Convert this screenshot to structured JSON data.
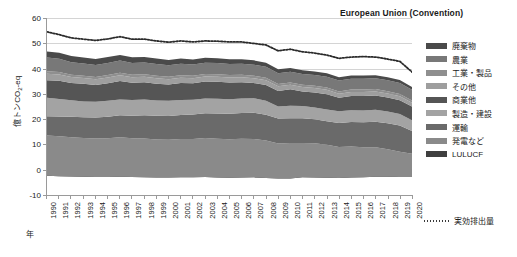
{
  "chart_data": {
    "type": "area",
    "title": "European Union (Convention)",
    "xlabel": "年",
    "ylabel": "億トンCO2-eq",
    "ylim": [
      -10,
      60
    ],
    "ytick_values": [
      -10,
      0,
      10,
      20,
      30,
      40,
      50,
      60
    ],
    "grid": true,
    "legend_position": "right",
    "stacked": true,
    "categories": [
      "1990",
      "1991",
      "1992",
      "1993",
      "1994",
      "1995",
      "1996",
      "1997",
      "1998",
      "1999",
      "2000",
      "2001",
      "2002",
      "2003",
      "2004",
      "2005",
      "2006",
      "2007",
      "2008",
      "2009",
      "2010",
      "2011",
      "2012",
      "2013",
      "2014",
      "2015",
      "2016",
      "2017",
      "2018",
      "2019",
      "2020"
    ],
    "stack_order_bottom_to_top": [
      "LULUCF",
      "発電など",
      "運輸",
      "製造・建設",
      "商業他",
      "その他",
      "工業・製品",
      "農業",
      "廃棄物"
    ],
    "series": [
      {
        "name": "LULUCF",
        "color": "#3f3f3f",
        "values": [
          -2.6,
          -2.8,
          -2.9,
          -3.0,
          -3.1,
          -3.1,
          -3.0,
          -3.1,
          -3.2,
          -3.3,
          -3.3,
          -3.2,
          -3.2,
          -3.1,
          -3.3,
          -3.4,
          -3.3,
          -3.2,
          -3.5,
          -3.6,
          -3.6,
          -3.2,
          -3.3,
          -3.4,
          -3.5,
          -3.3,
          -3.2,
          -3.0,
          -3.0,
          -3.1,
          -3.1
        ]
      },
      {
        "name": "発電など",
        "color": "#8a8a8a",
        "values": [
          16.0,
          15.9,
          15.6,
          15.4,
          15.3,
          15.4,
          15.7,
          15.4,
          15.4,
          15.1,
          15.0,
          15.2,
          15.2,
          15.5,
          15.4,
          15.3,
          15.4,
          15.2,
          14.9,
          13.8,
          14.0,
          13.6,
          13.6,
          13.1,
          12.3,
          12.3,
          11.9,
          11.7,
          11.0,
          10.1,
          9.3
        ]
      },
      {
        "name": "運輸",
        "color": "#6a6a6a",
        "values": [
          7.6,
          7.8,
          8.1,
          8.2,
          8.3,
          8.5,
          8.7,
          8.9,
          9.2,
          9.4,
          9.4,
          9.5,
          9.7,
          9.8,
          10.0,
          10.1,
          10.2,
          10.4,
          10.2,
          9.9,
          9.8,
          9.8,
          9.5,
          9.4,
          9.6,
          9.8,
          10.0,
          10.2,
          10.3,
          10.4,
          9.0
        ]
      },
      {
        "name": "製造・建設",
        "color": "#a3a3a3",
        "values": [
          7.4,
          7.0,
          6.6,
          6.3,
          6.3,
          6.4,
          6.3,
          6.3,
          6.3,
          6.1,
          6.1,
          6.0,
          5.9,
          5.9,
          5.9,
          5.8,
          5.8,
          5.8,
          5.6,
          4.8,
          5.0,
          4.9,
          4.7,
          4.6,
          4.6,
          4.6,
          4.6,
          4.7,
          4.6,
          4.5,
          4.3
        ]
      },
      {
        "name": "商業他",
        "color": "#555555",
        "values": [
          6.9,
          7.2,
          6.8,
          7.0,
          6.6,
          6.9,
          7.3,
          6.8,
          6.8,
          6.6,
          6.4,
          6.7,
          6.5,
          6.7,
          6.7,
          6.6,
          6.4,
          6.0,
          6.2,
          6.2,
          6.5,
          5.8,
          6.0,
          6.1,
          5.4,
          5.7,
          5.8,
          5.7,
          5.6,
          5.5,
          5.4
        ]
      },
      {
        "name": "その他",
        "color": "#9e9e9e",
        "values": [
          2.6,
          2.5,
          2.4,
          2.3,
          2.3,
          2.3,
          2.3,
          2.2,
          2.2,
          2.2,
          2.1,
          2.1,
          2.0,
          2.0,
          2.0,
          2.0,
          2.0,
          1.9,
          1.9,
          1.8,
          1.8,
          1.7,
          1.7,
          1.7,
          1.6,
          1.6,
          1.6,
          1.6,
          1.6,
          1.6,
          1.5
        ]
      },
      {
        "name": "工業・製品",
        "color": "#8f8f8f",
        "values": [
          1.0,
          1.0,
          0.9,
          0.9,
          0.9,
          1.0,
          1.0,
          1.0,
          1.0,
          1.0,
          1.0,
          1.0,
          1.0,
          1.0,
          1.0,
          1.0,
          1.0,
          1.0,
          1.0,
          0.9,
          0.9,
          0.9,
          0.9,
          0.9,
          0.9,
          0.9,
          0.9,
          0.9,
          0.9,
          0.9,
          0.9
        ]
      },
      {
        "name": "農業",
        "color": "#787878",
        "values": [
          5.4,
          5.2,
          5.0,
          4.9,
          4.8,
          4.8,
          4.8,
          4.7,
          4.7,
          4.7,
          4.6,
          4.6,
          4.5,
          4.5,
          4.5,
          4.4,
          4.4,
          4.4,
          4.4,
          4.3,
          4.3,
          4.3,
          4.3,
          4.3,
          4.3,
          4.3,
          4.3,
          4.3,
          4.3,
          4.3,
          4.2
        ]
      },
      {
        "name": "廃棄物",
        "color": "#4a4a4a",
        "values": [
          2.4,
          2.4,
          2.4,
          2.3,
          2.3,
          2.3,
          2.2,
          2.2,
          2.1,
          2.1,
          2.0,
          2.0,
          1.9,
          1.9,
          1.8,
          1.8,
          1.7,
          1.7,
          1.6,
          1.6,
          1.5,
          1.5,
          1.4,
          1.4,
          1.3,
          1.3,
          1.3,
          1.2,
          1.2,
          1.2,
          1.1
        ]
      }
    ],
    "overlay_line": {
      "name": "実効排出量",
      "style": "dotted",
      "color": "#2b2b2b",
      "values": [
        54.5,
        53.4,
        52.1,
        51.6,
        51.1,
        51.7,
        52.6,
        51.6,
        51.6,
        50.9,
        50.4,
        50.9,
        50.5,
        50.9,
        50.8,
        50.5,
        50.5,
        49.9,
        49.3,
        47.0,
        47.6,
        46.6,
        46.1,
        45.3,
        44.0,
        44.5,
        44.7,
        44.5,
        43.7,
        42.8,
        38.6
      ]
    }
  },
  "legend": {
    "items": [
      {
        "label": "廃棄物",
        "color": "#4a4a4a"
      },
      {
        "label": "農業",
        "color": "#787878"
      },
      {
        "label": "工業・製品",
        "color": "#8f8f8f"
      },
      {
        "label": "その他",
        "color": "#9e9e9e"
      },
      {
        "label": "商業他",
        "color": "#555555"
      },
      {
        "label": "製造・建設",
        "color": "#a3a3a3"
      },
      {
        "label": "運輸",
        "color": "#6a6a6a"
      },
      {
        "label": "発電など",
        "color": "#8a8a8a"
      },
      {
        "label": "LULUCF",
        "color": "#3f3f3f"
      }
    ],
    "line_entry": {
      "label": "実効排出量",
      "color": "#2b2b2b"
    }
  }
}
